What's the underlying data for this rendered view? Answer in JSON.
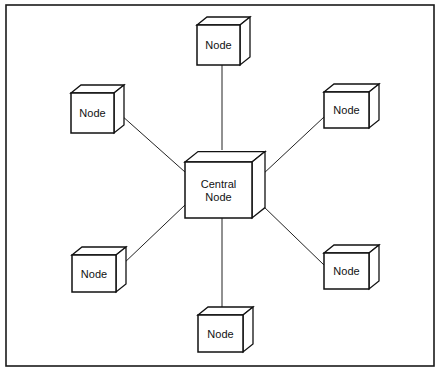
{
  "diagram": {
    "type": "star-topology",
    "frame_color": "#1a1a1a",
    "line_color": "#222222",
    "box_fill": "#ffffff",
    "center": {
      "id": "central",
      "label_lines": [
        "Central",
        "Node"
      ],
      "x": 185,
      "y": 162,
      "w": 67,
      "h": 56,
      "d": 13
    },
    "nodes": [
      {
        "id": "top",
        "label": "Node",
        "x": 197,
        "y": 25,
        "w": 43,
        "h": 40,
        "d": 10
      },
      {
        "id": "upper-left",
        "label": "Node",
        "x": 71,
        "y": 93,
        "w": 43,
        "h": 40,
        "d": 10
      },
      {
        "id": "upper-right",
        "label": "Node",
        "x": 324,
        "y": 92,
        "w": 45,
        "h": 36,
        "d": 10
      },
      {
        "id": "lower-left",
        "label": "Node",
        "x": 72,
        "y": 255,
        "w": 44,
        "h": 37,
        "d": 10
      },
      {
        "id": "lower-right",
        "label": "Node",
        "x": 324,
        "y": 253,
        "w": 45,
        "h": 36,
        "d": 10
      },
      {
        "id": "bottom",
        "label": "Node",
        "x": 198,
        "y": 315,
        "w": 45,
        "h": 37,
        "d": 10
      }
    ],
    "edges": [
      {
        "from": "central",
        "to": "top",
        "x1": 222,
        "y1": 150,
        "x2": 222,
        "y2": 65
      },
      {
        "from": "central",
        "to": "upper-left",
        "x1": 185,
        "y1": 172,
        "x2": 121,
        "y2": 115
      },
      {
        "from": "central",
        "to": "upper-right",
        "x1": 262,
        "y1": 175,
        "x2": 324,
        "y2": 117
      },
      {
        "from": "central",
        "to": "lower-left",
        "x1": 185,
        "y1": 205,
        "x2": 122,
        "y2": 265
      },
      {
        "from": "central",
        "to": "lower-right",
        "x1": 262,
        "y1": 205,
        "x2": 324,
        "y2": 265
      },
      {
        "from": "central",
        "to": "bottom",
        "x1": 222,
        "y1": 218,
        "x2": 222,
        "y2": 311
      }
    ]
  }
}
